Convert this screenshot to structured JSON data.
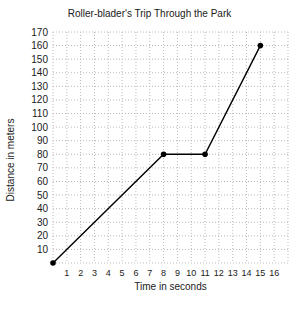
{
  "chart_data": {
    "type": "line",
    "title": "Roller-blader's Trip Through the Park",
    "xlabel": "Time in seconds",
    "ylabel": "Distance in meters",
    "x_ticks": [
      1,
      2,
      3,
      4,
      5,
      6,
      7,
      8,
      9,
      10,
      11,
      12,
      13,
      14,
      15,
      16
    ],
    "y_ticks": [
      10,
      20,
      30,
      40,
      50,
      60,
      70,
      80,
      90,
      100,
      110,
      120,
      130,
      140,
      150,
      160,
      170
    ],
    "xlim": [
      0,
      17
    ],
    "ylim": [
      0,
      170
    ],
    "grid": "dotted",
    "legend": "none",
    "series": [
      {
        "name": "roller-blader-distance",
        "points": [
          {
            "x": 0,
            "y": 0
          },
          {
            "x": 8,
            "y": 80
          },
          {
            "x": 11,
            "y": 80
          },
          {
            "x": 15,
            "y": 160
          }
        ]
      }
    ],
    "colors": {
      "line": "#000000",
      "marker": "#000000",
      "grid": "#b9b9b9",
      "text": "#1a1a1a",
      "background": "#ffffff"
    }
  }
}
